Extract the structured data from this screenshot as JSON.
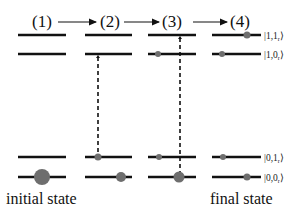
{
  "diagram": {
    "steps": [
      {
        "label": "(1)",
        "x": 42
      },
      {
        "label": "(2)",
        "x": 110
      },
      {
        "label": "(3)",
        "x": 172
      },
      {
        "label": "(4)",
        "x": 240
      }
    ],
    "arrows": [
      {
        "from": "(1)",
        "to": "(2)",
        "x1": 58,
        "x2": 97
      },
      {
        "from": "(2)",
        "to": "(3)",
        "x1": 124,
        "x2": 160
      },
      {
        "from": "(3)",
        "to": "(4)",
        "x1": 193,
        "x2": 228
      }
    ],
    "states": [
      {
        "ket": "|1,1_r⟩",
        "main": "|1,1",
        "sub": "r",
        "close": "⟩",
        "y": 35
      },
      {
        "ket": "|1,0_r⟩",
        "main": "|1,0",
        "sub": "r",
        "close": "⟩",
        "y": 54
      },
      {
        "ket": "|0,1_r⟩",
        "main": "|0,1",
        "sub": "r",
        "close": "⟩",
        "y": 157
      },
      {
        "ket": "|0,0_r⟩",
        "main": "|0,0",
        "sub": "r",
        "close": "⟩",
        "y": 177
      }
    ],
    "columns": [
      {
        "x1": 18,
        "x2": 66
      },
      {
        "x1": 85,
        "x2": 132
      },
      {
        "x1": 148,
        "x2": 196
      },
      {
        "x1": 212,
        "x2": 261
      }
    ],
    "transitions": [
      {
        "column": 2,
        "x": 98,
        "from_state": "|1,0_r⟩",
        "to_state": "|0,1_r⟩",
        "style": "dashed"
      },
      {
        "column": 3,
        "x": 180,
        "from_state": "|1,1_r⟩",
        "to_state": "|0,0_r⟩",
        "style": "dashed"
      }
    ],
    "populations": [
      {
        "column": 1,
        "state": "|0,0_r⟩",
        "x": 42,
        "r": 8
      },
      {
        "column": 2,
        "state": "|0,1_r⟩",
        "x": 98,
        "r": 3.5
      },
      {
        "column": 2,
        "state": "|0,0_r⟩",
        "x": 121,
        "r": 5
      },
      {
        "column": 3,
        "state": "|1,0_r⟩",
        "x": 158,
        "r": 3
      },
      {
        "column": 3,
        "state": "|0,1_r⟩",
        "x": 159,
        "r": 3
      },
      {
        "column": 3,
        "state": "|0,0_r⟩",
        "x": 179,
        "r": 5.5
      },
      {
        "column": 4,
        "state": "|1,1_r⟩",
        "x": 247,
        "r": 3.5
      },
      {
        "column": 4,
        "state": "|1,0_r⟩",
        "x": 222,
        "r": 3
      },
      {
        "column": 4,
        "state": "|0,1_r⟩",
        "x": 223,
        "r": 3
      },
      {
        "column": 4,
        "state": "|0,0_r⟩",
        "x": 247,
        "r": 3.5
      }
    ],
    "captions": {
      "initial": "initial state",
      "final": "final state"
    },
    "colors": {
      "line": "#111111",
      "dot": "#6e6e6e",
      "text": "#111111"
    }
  }
}
